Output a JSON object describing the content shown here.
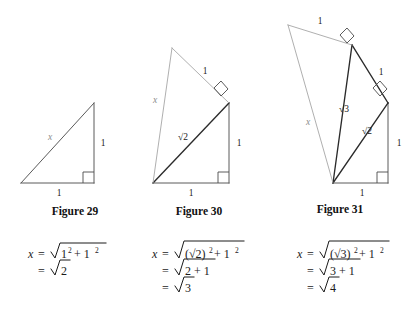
{
  "page": {
    "background": "#ffffff",
    "ink": "#1a1a1a",
    "accent_dark": "#2b2b2b",
    "accent_light": "#a6a6a6"
  },
  "figures": [
    {
      "id": "figure-29",
      "caption": "Figure 29",
      "caption_pos": {
        "x": 75,
        "y": 215
      },
      "labels": [
        {
          "name": "hypotenuse-label-x",
          "text": "x",
          "x": 50,
          "y": 140,
          "style": "x"
        },
        {
          "name": "vertical-leg-label",
          "text": "1",
          "x": 103,
          "y": 144,
          "style": "plain"
        },
        {
          "name": "base-label",
          "text": "1",
          "x": 59,
          "y": 196,
          "style": "plain"
        }
      ]
    },
    {
      "id": "figure-30",
      "caption": "Figure 30",
      "caption_pos": {
        "x": 199,
        "y": 215
      },
      "labels": [
        {
          "name": "outer-hypotenuse-label-x",
          "text": "x",
          "x": 155,
          "y": 103,
          "style": "x"
        },
        {
          "name": "outer-leg-label",
          "text": "1",
          "x": 205,
          "y": 72,
          "style": "plain"
        },
        {
          "name": "inner-hypotenuse-label",
          "text": "√2",
          "x": 183,
          "y": 138,
          "style": "radical"
        },
        {
          "name": "vertical-leg-label",
          "text": "1",
          "x": 239,
          "y": 144,
          "style": "plain"
        },
        {
          "name": "base-label",
          "text": "1",
          "x": 191,
          "y": 196,
          "style": "plain"
        }
      ]
    },
    {
      "id": "figure-31",
      "caption": "Figure 31",
      "caption_pos": {
        "x": 340,
        "y": 213
      },
      "labels": [
        {
          "name": "outer-hypotenuse-label-x",
          "text": "x",
          "x": 308,
          "y": 123,
          "style": "x"
        },
        {
          "name": "outer-leg-label",
          "text": "1",
          "x": 320,
          "y": 22,
          "style": "plain"
        },
        {
          "name": "sqrt3-label",
          "text": "√3",
          "x": 344,
          "y": 110,
          "style": "radical"
        },
        {
          "name": "mid-leg-label",
          "text": "1",
          "x": 380,
          "y": 73,
          "style": "plain"
        },
        {
          "name": "sqrt2-label",
          "text": "√2",
          "x": 367,
          "y": 132,
          "style": "radical"
        },
        {
          "name": "vertical-leg-label",
          "text": "1",
          "x": 398,
          "y": 144,
          "style": "plain"
        },
        {
          "name": "base-label",
          "text": "1",
          "x": 362,
          "y": 196,
          "style": "plain"
        }
      ]
    }
  ],
  "equations": [
    {
      "id": "equation-29",
      "lines": [
        {
          "lhs": "x",
          "rel": "=",
          "radicand": "1² + 1²"
        },
        {
          "lhs": "",
          "rel": "=",
          "radicand": "2"
        }
      ]
    },
    {
      "id": "equation-30",
      "lines": [
        {
          "lhs": "x",
          "rel": "=",
          "radicand": "(√2)² + 1²"
        },
        {
          "lhs": "",
          "rel": "=",
          "radicand": "2 + 1"
        },
        {
          "lhs": "",
          "rel": "=",
          "radicand": "3"
        }
      ]
    },
    {
      "id": "equation-31",
      "lines": [
        {
          "lhs": "x",
          "rel": "=",
          "radicand": "(√3)² + 1²"
        },
        {
          "lhs": "",
          "rel": "=",
          "radicand": "3 + 1"
        },
        {
          "lhs": "",
          "rel": "=",
          "radicand": "4"
        }
      ]
    }
  ],
  "equation_text": {
    "eq29_l1_lhs": "x",
    "eq29_l1_eq": "=",
    "eq29_l1_rad": "1",
    "eq29_l1_sup1": "2",
    "eq29_l1_plus": "+ 1",
    "eq29_l1_sup2": "2",
    "eq29_l2_eq": "=",
    "eq29_l2_rad": "2",
    "eq30_l1_lhs": "x",
    "eq30_l1_eq": "=",
    "eq30_l1_rad": "(√2)",
    "eq30_l1_sup1": "2",
    "eq30_l1_plus": "+ 1",
    "eq30_l1_sup2": "2",
    "eq30_l2_eq": "=",
    "eq30_l2_rad": "2 + 1",
    "eq30_l3_eq": "=",
    "eq30_l3_rad": "3",
    "eq31_l1_lhs": "x",
    "eq31_l1_eq": "=",
    "eq31_l1_rad": "(√3)",
    "eq31_l1_sup1": "2",
    "eq31_l1_plus": "+ 1",
    "eq31_l1_sup2": "2",
    "eq31_l2_eq": "=",
    "eq31_l2_rad": "3 + 1",
    "eq31_l3_eq": "=",
    "eq31_l3_rad": "4"
  },
  "captions": {
    "fig29": "Figure 29",
    "fig30": "Figure 30",
    "fig31": "Figure 31"
  }
}
